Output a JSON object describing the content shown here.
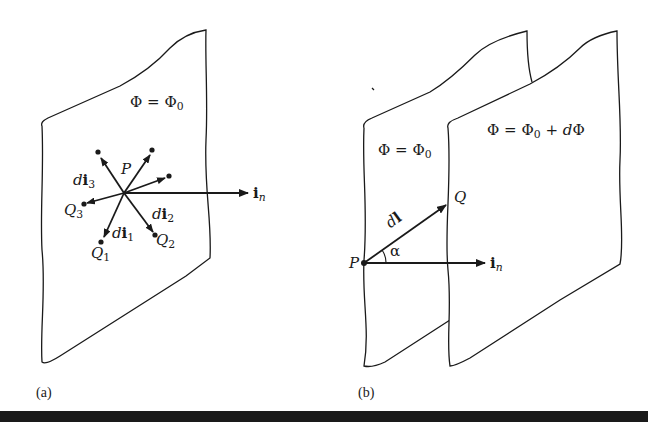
{
  "figure": {
    "panels": [
      {
        "id": "a",
        "caption": "(a)",
        "surface_label": {
          "lhs": "Φ",
          "eq": "=",
          "rhs": "Φ",
          "rhs_sub": "0"
        },
        "point_label": "P",
        "vectors": [
          {
            "name": "di1",
            "d": "d",
            "i": "i",
            "sub": "1",
            "endpoint": "Q",
            "endpoint_sub": "1"
          },
          {
            "name": "di2",
            "d": "d",
            "i": "i",
            "sub": "2",
            "endpoint": "Q",
            "endpoint_sub": "2"
          },
          {
            "name": "di3",
            "d": "d",
            "i": "i",
            "sub": "3",
            "endpoint": "Q",
            "endpoint_sub": "3"
          }
        ],
        "normal": {
          "i": "i",
          "sub": "n"
        }
      },
      {
        "id": "b",
        "caption": "(b)",
        "surface1_label": {
          "lhs": "Φ",
          "eq": "=",
          "rhs": "Φ",
          "rhs_sub": "0"
        },
        "surface2_label": {
          "lhs": "Φ",
          "eq": "=",
          "rhs": "Φ",
          "rhs_sub": "0",
          "plus": "+",
          "d": "d",
          "dphi": "Φ"
        },
        "point_P": "P",
        "point_Q": "Q",
        "dl_label": {
          "d": "d",
          "l": "l"
        },
        "angle_label": "α",
        "normal": {
          "i": "i",
          "sub": "n"
        }
      }
    ],
    "colors": {
      "line": "#1a1a1a",
      "background": "#ffffff"
    }
  }
}
